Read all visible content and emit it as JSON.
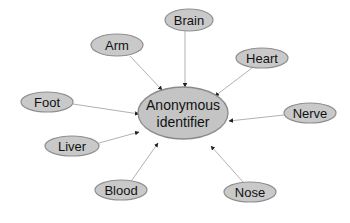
{
  "diagram": {
    "type": "hub-and-spoke",
    "center": {
      "label_line1": "Anonymous",
      "label_line2": "identifier",
      "cx": 183,
      "cy": 113,
      "rx": 45,
      "ry": 26
    },
    "nodes": [
      {
        "id": "brain",
        "label": "Brain",
        "cx": 189,
        "cy": 20,
        "rx": 24,
        "ry": 11
      },
      {
        "id": "arm",
        "label": "Arm",
        "cx": 117,
        "cy": 45,
        "rx": 26,
        "ry": 11
      },
      {
        "id": "heart",
        "label": "Heart",
        "cx": 262,
        "cy": 58,
        "rx": 26,
        "ry": 10
      },
      {
        "id": "foot",
        "label": "Foot",
        "cx": 47,
        "cy": 102,
        "rx": 26,
        "ry": 10
      },
      {
        "id": "nerve",
        "label": "Nerve",
        "cx": 310,
        "cy": 113,
        "rx": 26,
        "ry": 10
      },
      {
        "id": "liver",
        "label": "Liver",
        "cx": 72,
        "cy": 146,
        "rx": 27,
        "ry": 10
      },
      {
        "id": "blood",
        "label": "Blood",
        "cx": 121,
        "cy": 190,
        "rx": 26,
        "ry": 10
      },
      {
        "id": "nose",
        "label": "Nose",
        "cx": 250,
        "cy": 192,
        "rx": 26,
        "ry": 10
      }
    ],
    "edges": [
      {
        "from": "brain",
        "to": "center",
        "x1": 185,
        "y1": 31,
        "x2": 185,
        "y2": 87
      },
      {
        "from": "arm",
        "to": "center",
        "x1": 130,
        "y1": 56,
        "x2": 162,
        "y2": 90
      },
      {
        "from": "heart",
        "to": "center",
        "x1": 252,
        "y1": 68,
        "x2": 215,
        "y2": 96
      },
      {
        "from": "foot",
        "to": "center",
        "x1": 73,
        "y1": 104,
        "x2": 139,
        "y2": 114
      },
      {
        "from": "nerve",
        "to": "center",
        "x1": 284,
        "y1": 115,
        "x2": 229,
        "y2": 121
      },
      {
        "from": "liver",
        "to": "center",
        "x1": 99,
        "y1": 143,
        "x2": 139,
        "y2": 132
      },
      {
        "from": "blood",
        "to": "center",
        "x1": 132,
        "y1": 180,
        "x2": 158,
        "y2": 143
      },
      {
        "from": "nose",
        "to": "center",
        "x1": 243,
        "y1": 182,
        "x2": 211,
        "y2": 146
      }
    ],
    "colors": {
      "node_fill": "#c9c9c9",
      "node_stroke": "#8f8f8f",
      "edge": "#a8a8a8",
      "text": "#111111",
      "background": "#ffffff"
    }
  }
}
